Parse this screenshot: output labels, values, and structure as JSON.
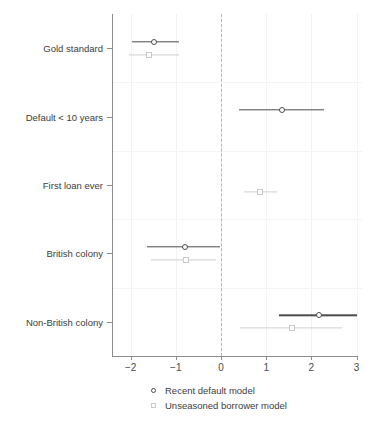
{
  "chart_data": {
    "type": "scatter",
    "subtype": "coefficient-forest-plot",
    "title": "",
    "xlabel": "",
    "ylabel": "",
    "xlim": [
      -2.2,
      3.05
    ],
    "xticks": [
      -2,
      -1,
      0,
      1,
      2,
      3
    ],
    "xticklabels": [
      "−2",
      "−1",
      "0",
      "1",
      "2",
      "3"
    ],
    "grid": true,
    "reference_line": 0,
    "reference_line_style": "dashed",
    "legend_position": "bottom",
    "categories": [
      "Gold standard",
      "Default < 10 years",
      "First loan ever",
      "British colony",
      "Non-British colony"
    ],
    "series": [
      {
        "name": "Recent default model",
        "marker": "circle",
        "color": "#4d4d4d",
        "points": [
          {
            "category": "Gold standard",
            "estimate": -1.48,
            "low": -1.98,
            "high": -0.92
          },
          {
            "category": "Default < 10 years",
            "estimate": 1.36,
            "low": 0.4,
            "high": 2.27
          },
          {
            "category": "First loan ever",
            "estimate": null,
            "low": null,
            "high": null
          },
          {
            "category": "British colony",
            "estimate": -0.8,
            "low": -1.63,
            "high": -0.02
          },
          {
            "category": "Non-British colony",
            "estimate": 2.16,
            "low": 1.29,
            "high": 3.02
          }
        ]
      },
      {
        "name": "Unseasoned borrower model",
        "marker": "square",
        "color": "#c9c9c9",
        "points": [
          {
            "category": "Gold standard",
            "estimate": -1.6,
            "low": -2.03,
            "high": -0.93
          },
          {
            "category": "Default < 10 years",
            "estimate": null,
            "low": null,
            "high": null
          },
          {
            "category": "First loan ever",
            "estimate": 0.86,
            "low": 0.5,
            "high": 1.25
          },
          {
            "category": "British colony",
            "estimate": -0.78,
            "low": -1.54,
            "high": -0.12
          },
          {
            "category": "Non-British colony",
            "estimate": 1.58,
            "low": 0.42,
            "high": 2.68
          }
        ]
      }
    ]
  },
  "legend": {
    "items": [
      {
        "label": "Recent default model",
        "marker": "circle"
      },
      {
        "label": "Unseasoned borrower model",
        "marker": "square"
      }
    ]
  }
}
